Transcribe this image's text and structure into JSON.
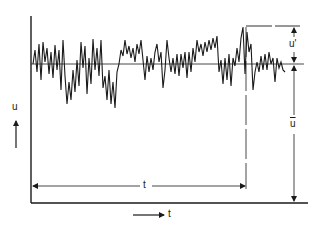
{
  "figure": {
    "labels": {
      "y_axis": "u",
      "x_axis": "t",
      "interval": "t",
      "fluctuation": "u'",
      "mean": "ū"
    },
    "colors": {
      "ink": "#1a1a1a",
      "background": "#ffffff"
    },
    "signal_points": [
      [
        33,
        64
      ],
      [
        35,
        50
      ],
      [
        37,
        72
      ],
      [
        39,
        44
      ],
      [
        41,
        80
      ],
      [
        43,
        42
      ],
      [
        45,
        62
      ],
      [
        47,
        48
      ],
      [
        49,
        74
      ],
      [
        51,
        52
      ],
      [
        53,
        78
      ],
      [
        55,
        45
      ],
      [
        57,
        70
      ],
      [
        59,
        50
      ],
      [
        61,
        90
      ],
      [
        63,
        40
      ],
      [
        65,
        76
      ],
      [
        67,
        104
      ],
      [
        69,
        82
      ],
      [
        71,
        100
      ],
      [
        73,
        70
      ],
      [
        75,
        92
      ],
      [
        77,
        60
      ],
      [
        79,
        86
      ],
      [
        81,
        42
      ],
      [
        83,
        68
      ],
      [
        85,
        46
      ],
      [
        87,
        94
      ],
      [
        89,
        58
      ],
      [
        91,
        84
      ],
      [
        93,
        39
      ],
      [
        95,
        70
      ],
      [
        97,
        48
      ],
      [
        99,
        76
      ],
      [
        101,
        40
      ],
      [
        103,
        88
      ],
      [
        105,
        76
      ],
      [
        107,
        100
      ],
      [
        109,
        70
      ],
      [
        111,
        104
      ],
      [
        113,
        82
      ],
      [
        115,
        108
      ],
      [
        117,
        72
      ],
      [
        119,
        64
      ],
      [
        121,
        50
      ],
      [
        123,
        56
      ],
      [
        125,
        40
      ],
      [
        127,
        54
      ],
      [
        129,
        46
      ],
      [
        131,
        58
      ],
      [
        133,
        48
      ],
      [
        135,
        62
      ],
      [
        137,
        44
      ],
      [
        139,
        54
      ],
      [
        141,
        40
      ],
      [
        143,
        60
      ],
      [
        145,
        80
      ],
      [
        147,
        56
      ],
      [
        149,
        72
      ],
      [
        151,
        58
      ],
      [
        153,
        70
      ],
      [
        155,
        52
      ],
      [
        157,
        44
      ],
      [
        159,
        62
      ],
      [
        161,
        52
      ],
      [
        163,
        88
      ],
      [
        165,
        70
      ],
      [
        167,
        40
      ],
      [
        169,
        58
      ],
      [
        171,
        72
      ],
      [
        173,
        58
      ],
      [
        175,
        74
      ],
      [
        177,
        54
      ],
      [
        179,
        76
      ],
      [
        181,
        54
      ],
      [
        183,
        68
      ],
      [
        185,
        52
      ],
      [
        187,
        78
      ],
      [
        189,
        52
      ],
      [
        191,
        72
      ],
      [
        193,
        48
      ],
      [
        195,
        62
      ],
      [
        197,
        40
      ],
      [
        199,
        52
      ],
      [
        201,
        44
      ],
      [
        203,
        56
      ],
      [
        205,
        42
      ],
      [
        207,
        52
      ],
      [
        209,
        40
      ],
      [
        211,
        50
      ],
      [
        213,
        38
      ],
      [
        215,
        48
      ],
      [
        217,
        36
      ],
      [
        219,
        72
      ],
      [
        221,
        60
      ],
      [
        223,
        84
      ],
      [
        225,
        58
      ],
      [
        227,
        80
      ],
      [
        229,
        54
      ],
      [
        231,
        86
      ],
      [
        233,
        58
      ],
      [
        235,
        66
      ],
      [
        237,
        48
      ],
      [
        239,
        62
      ],
      [
        241,
        38
      ],
      [
        243,
        27
      ],
      [
        245,
        74
      ],
      [
        247,
        32
      ],
      [
        249,
        52
      ],
      [
        251,
        44
      ],
      [
        253,
        90
      ],
      [
        255,
        72
      ],
      [
        257,
        62
      ],
      [
        259,
        72
      ],
      [
        261,
        56
      ],
      [
        263,
        70
      ],
      [
        265,
        54
      ],
      [
        267,
        70
      ],
      [
        269,
        52
      ],
      [
        271,
        64
      ],
      [
        273,
        58
      ],
      [
        275,
        82
      ],
      [
        277,
        58
      ],
      [
        279,
        68
      ],
      [
        281,
        62
      ],
      [
        283,
        70
      ],
      [
        285,
        72
      ]
    ],
    "geometry": {
      "y_axis_x": 31,
      "y_axis_top": 16,
      "x_axis_y": 203,
      "x_axis_right": 308,
      "mean_y": 64,
      "peak_x": 246,
      "peak_y": 27,
      "interval_arrow_y": 186,
      "dim_arrow_x": 294
    }
  }
}
